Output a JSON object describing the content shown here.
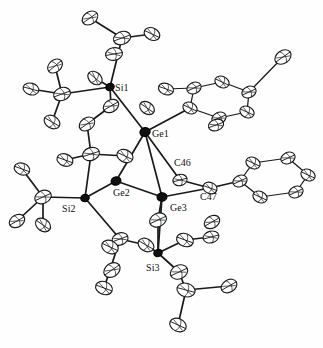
{
  "figure": {
    "kind": "ortep-thermal-ellipsoid-plot",
    "background_color": "#fefefe",
    "line_color": "#1a1a1a",
    "dark_atom_color": "#101010",
    "width": 323,
    "height": 348
  },
  "labels": [
    {
      "id": "si1",
      "text": "Si1",
      "x": 115,
      "y": 91
    },
    {
      "id": "ge1",
      "text": "Ge1",
      "x": 152,
      "y": 137
    },
    {
      "id": "c46",
      "text": "C46",
      "x": 174,
      "y": 166
    },
    {
      "id": "ge2",
      "text": "Ge2",
      "x": 113,
      "y": 196
    },
    {
      "id": "ge3",
      "text": "Ge3",
      "x": 170,
      "y": 211
    },
    {
      "id": "c47",
      "text": "C47",
      "x": 200,
      "y": 200
    },
    {
      "id": "si2",
      "text": "Si2",
      "x": 62,
      "y": 212
    },
    {
      "id": "si3",
      "text": "Si3",
      "x": 146,
      "y": 271
    }
  ],
  "core_atoms": [
    {
      "id": "Ge1",
      "element": "Ge",
      "x": 145,
      "y": 132,
      "rx": 5.2,
      "ry": 4.4,
      "rot": -18,
      "shade": "dark"
    },
    {
      "id": "Ge2",
      "element": "Ge",
      "x": 116,
      "y": 181,
      "rx": 5.0,
      "ry": 4.2,
      "rot": -14,
      "shade": "dark"
    },
    {
      "id": "Ge3",
      "element": "Ge",
      "x": 162,
      "y": 197,
      "rx": 5.0,
      "ry": 4.2,
      "rot": -10,
      "shade": "dark"
    },
    {
      "id": "Si1",
      "element": "Si",
      "x": 110,
      "y": 87,
      "rx": 4.3,
      "ry": 3.6,
      "rot": -25,
      "shade": "dark"
    },
    {
      "id": "Si2",
      "element": "Si",
      "x": 85,
      "y": 198,
      "rx": 4.3,
      "ry": 3.6,
      "rot": -18,
      "shade": "dark"
    },
    {
      "id": "Si3",
      "element": "Si",
      "x": 158,
      "y": 253,
      "rx": 4.3,
      "ry": 3.6,
      "rot": -22,
      "shade": "dark"
    }
  ],
  "carbon_atoms": [
    {
      "id": "c-t1",
      "x": 90,
      "y": 18,
      "rx": 8.5,
      "ry": 6.2,
      "rot": -35
    },
    {
      "id": "c-t2",
      "x": 122,
      "y": 38,
      "rx": 8.8,
      "ry": 6.4,
      "rot": -20
    },
    {
      "id": "c-t3",
      "x": 152,
      "y": 34,
      "rx": 8.2,
      "ry": 6.0,
      "rot": 25
    },
    {
      "id": "c-t4",
      "x": 114,
      "y": 54,
      "rx": 8.5,
      "ry": 6.3,
      "rot": -10
    },
    {
      "id": "c-s1a",
      "x": 95,
      "y": 78,
      "rx": 8.0,
      "ry": 5.8,
      "rot": 40
    },
    {
      "id": "c-s1b",
      "x": 111,
      "y": 106,
      "rx": 8.2,
      "ry": 6.0,
      "rot": -30
    },
    {
      "id": "c-s1c",
      "x": 147,
      "y": 108,
      "rx": 8.0,
      "ry": 5.8,
      "rot": 35
    },
    {
      "id": "c-l1",
      "x": 62,
      "y": 94,
      "rx": 8.6,
      "ry": 6.4,
      "rot": -20
    },
    {
      "id": "c-l2",
      "x": 31,
      "y": 89,
      "rx": 8.0,
      "ry": 5.8,
      "rot": 15
    },
    {
      "id": "c-l3",
      "x": 55,
      "y": 66,
      "rx": 8.2,
      "ry": 6.0,
      "rot": -40
    },
    {
      "id": "c-l4",
      "x": 52,
      "y": 122,
      "rx": 8.4,
      "ry": 6.2,
      "rot": 30
    },
    {
      "id": "c-l5",
      "x": 87,
      "y": 124,
      "rx": 8.4,
      "ry": 6.2,
      "rot": -35
    },
    {
      "id": "c-l6",
      "x": 91,
      "y": 154,
      "rx": 8.6,
      "ry": 6.4,
      "rot": -18
    },
    {
      "id": "c-l7",
      "x": 65,
      "y": 160,
      "rx": 8.2,
      "ry": 6.0,
      "rot": 20
    },
    {
      "id": "c-l8",
      "x": 125,
      "y": 156,
      "rx": 8.4,
      "ry": 6.2,
      "rot": 25
    },
    {
      "id": "c-s2a",
      "x": 43,
      "y": 197,
      "rx": 8.6,
      "ry": 6.4,
      "rot": -25
    },
    {
      "id": "c-s2b",
      "x": 22,
      "y": 169,
      "rx": 8.0,
      "ry": 5.8,
      "rot": 20
    },
    {
      "id": "c-s2c",
      "x": 17,
      "y": 221,
      "rx": 8.2,
      "ry": 6.0,
      "rot": -30
    },
    {
      "id": "c-s2d",
      "x": 43,
      "y": 225,
      "rx": 8.2,
      "ry": 6.0,
      "rot": 35
    },
    {
      "id": "c46",
      "x": 180,
      "y": 180,
      "rx": 7.2,
      "ry": 5.6,
      "rot": -15
    },
    {
      "id": "c47",
      "x": 210,
      "y": 188,
      "rx": 7.2,
      "ry": 5.6,
      "rot": 20
    },
    {
      "id": "c-b1",
      "x": 158,
      "y": 220,
      "rx": 8.8,
      "ry": 6.6,
      "rot": -25
    },
    {
      "id": "c-b2",
      "x": 185,
      "y": 240,
      "rx": 8.6,
      "ry": 6.4,
      "rot": 20
    },
    {
      "id": "c-b3",
      "x": 212,
      "y": 222,
      "rx": 8.2,
      "ry": 6.0,
      "rot": -30
    },
    {
      "id": "c-b4",
      "x": 146,
      "y": 245,
      "rx": 8.4,
      "ry": 6.2,
      "rot": 30
    },
    {
      "id": "c-b5",
      "x": 120,
      "y": 239,
      "rx": 8.2,
      "ry": 6.0,
      "rot": -20
    },
    {
      "id": "c-b6",
      "x": 110,
      "y": 247,
      "rx": 8.6,
      "ry": 6.4,
      "rot": 25
    },
    {
      "id": "c-b7",
      "x": 112,
      "y": 270,
      "rx": 8.8,
      "ry": 6.6,
      "rot": -35
    },
    {
      "id": "c-b8",
      "x": 104,
      "y": 288,
      "rx": 8.6,
      "ry": 6.4,
      "rot": 20
    },
    {
      "id": "c-b9",
      "x": 179,
      "y": 272,
      "rx": 9.0,
      "ry": 6.8,
      "rot": -25
    },
    {
      "id": "c-b10",
      "x": 186,
      "y": 290,
      "rx": 9.2,
      "ry": 6.8,
      "rot": 15
    },
    {
      "id": "c-b11",
      "x": 229,
      "y": 286,
      "rx": 8.4,
      "ry": 6.2,
      "rot": -30
    },
    {
      "id": "c-b12",
      "x": 178,
      "y": 325,
      "rx": 8.6,
      "ry": 6.4,
      "rot": 25
    },
    {
      "id": "c-b13",
      "x": 211,
      "y": 237,
      "rx": 8.0,
      "ry": 5.8,
      "rot": -15
    }
  ],
  "phenyl_ring_top": {
    "id": "phenyl-ge1",
    "vertices": [
      {
        "x": 190,
        "y": 108
      },
      {
        "x": 194,
        "y": 88
      },
      {
        "x": 222,
        "y": 82
      },
      {
        "x": 249,
        "y": 92
      },
      {
        "x": 247,
        "y": 112
      },
      {
        "x": 219,
        "y": 118
      }
    ],
    "substituents": [
      {
        "x": 166,
        "y": 89,
        "rx": 7.8,
        "ry": 5.6,
        "rot": 20
      },
      {
        "x": 216,
        "y": 125,
        "rx": 7.8,
        "ry": 5.6,
        "rot": -20
      },
      {
        "x": 283,
        "y": 57,
        "rx": 8.8,
        "ry": 6.4,
        "rot": -35
      }
    ]
  },
  "phenyl_ring_right": {
    "id": "phenyl-c47",
    "vertices": [
      {
        "x": 253,
        "y": 163
      },
      {
        "x": 288,
        "y": 158
      },
      {
        "x": 308,
        "y": 175
      },
      {
        "x": 296,
        "y": 192
      },
      {
        "x": 260,
        "y": 197
      },
      {
        "x": 240,
        "y": 181
      }
    ]
  },
  "bonds": [
    {
      "from": [
        145,
        132
      ],
      "to": [
        116,
        181
      ]
    },
    {
      "from": [
        145,
        132
      ],
      "to": [
        162,
        197
      ]
    },
    {
      "from": [
        116,
        181
      ],
      "to": [
        162,
        197
      ]
    },
    {
      "from": [
        145,
        132
      ],
      "to": [
        110,
        87
      ]
    },
    {
      "from": [
        116,
        181
      ],
      "to": [
        85,
        198
      ]
    },
    {
      "from": [
        162,
        197
      ],
      "to": [
        158,
        253
      ]
    },
    {
      "from": [
        145,
        132
      ],
      "to": [
        180,
        180
      ]
    },
    {
      "from": [
        180,
        180
      ],
      "to": [
        210,
        188
      ]
    },
    {
      "from": [
        210,
        188
      ],
      "to": [
        240,
        181
      ]
    },
    {
      "from": [
        162,
        197
      ],
      "to": [
        210,
        188
      ]
    },
    {
      "from": [
        145,
        132
      ],
      "to": [
        190,
        108
      ]
    },
    {
      "from": [
        110,
        87
      ],
      "to": [
        122,
        38
      ]
    },
    {
      "from": [
        122,
        38
      ],
      "to": [
        90,
        18
      ]
    },
    {
      "from": [
        122,
        38
      ],
      "to": [
        152,
        34
      ]
    },
    {
      "from": [
        110,
        87
      ],
      "to": [
        95,
        78
      ]
    },
    {
      "from": [
        110,
        87
      ],
      "to": [
        111,
        106
      ]
    },
    {
      "from": [
        110,
        87
      ],
      "to": [
        62,
        94
      ]
    },
    {
      "from": [
        62,
        94
      ],
      "to": [
        31,
        89
      ]
    },
    {
      "from": [
        62,
        94
      ],
      "to": [
        55,
        66
      ]
    },
    {
      "from": [
        62,
        94
      ],
      "to": [
        52,
        122
      ]
    },
    {
      "from": [
        111,
        106
      ],
      "to": [
        87,
        124
      ]
    },
    {
      "from": [
        87,
        124
      ],
      "to": [
        91,
        154
      ]
    },
    {
      "from": [
        91,
        154
      ],
      "to": [
        65,
        160
      ]
    },
    {
      "from": [
        91,
        154
      ],
      "to": [
        125,
        156
      ]
    },
    {
      "from": [
        91,
        154
      ],
      "to": [
        85,
        198
      ]
    },
    {
      "from": [
        85,
        198
      ],
      "to": [
        43,
        197
      ]
    },
    {
      "from": [
        43,
        197
      ],
      "to": [
        22,
        169
      ]
    },
    {
      "from": [
        43,
        197
      ],
      "to": [
        17,
        221
      ]
    },
    {
      "from": [
        43,
        197
      ],
      "to": [
        43,
        225
      ]
    },
    {
      "from": [
        85,
        198
      ],
      "to": [
        120,
        239
      ]
    },
    {
      "from": [
        120,
        239
      ],
      "to": [
        146,
        245
      ]
    },
    {
      "from": [
        146,
        245
      ],
      "to": [
        158,
        253
      ]
    },
    {
      "from": [
        120,
        239
      ],
      "to": [
        110,
        270
      ]
    },
    {
      "from": [
        110,
        270
      ],
      "to": [
        104,
        288
      ]
    },
    {
      "from": [
        158,
        253
      ],
      "to": [
        158,
        220
      ]
    },
    {
      "from": [
        158,
        220
      ],
      "to": [
        162,
        197
      ]
    },
    {
      "from": [
        158,
        253
      ],
      "to": [
        185,
        240
      ]
    },
    {
      "from": [
        185,
        240
      ],
      "to": [
        211,
        237
      ]
    },
    {
      "from": [
        158,
        253
      ],
      "to": [
        179,
        272
      ]
    },
    {
      "from": [
        179,
        272
      ],
      "to": [
        186,
        290
      ]
    },
    {
      "from": [
        186,
        290
      ],
      "to": [
        229,
        286
      ]
    },
    {
      "from": [
        186,
        290
      ],
      "to": [
        178,
        325
      ]
    }
  ]
}
